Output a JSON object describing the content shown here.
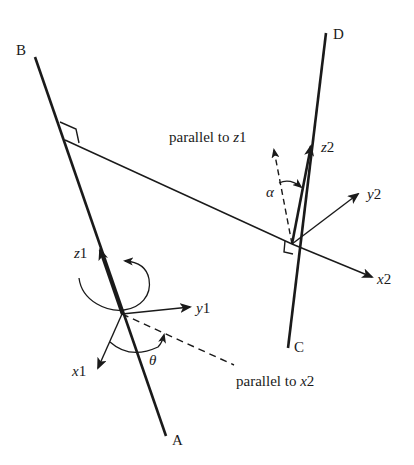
{
  "diagram": {
    "type": "kinematic-frame-diagram",
    "labels": {
      "point_b": "B",
      "point_a": "A",
      "point_d": "D",
      "point_c": "C",
      "parallel_z1_prefix": "parallel to ",
      "parallel_z1_var": "z",
      "parallel_z1_sub": "1",
      "parallel_x2_prefix": "parallel to ",
      "parallel_x2_var": "x",
      "parallel_x2_sub": "2",
      "z1_var": "z",
      "z1_sub": "1",
      "y1_var": "y",
      "y1_sub": "1",
      "x1_var": "x",
      "x1_sub": "1",
      "z2_var": "z",
      "z2_sub": "2",
      "y2_var": "y",
      "y2_sub": "2",
      "x2_var": "x",
      "x2_sub": "2",
      "theta": "θ",
      "alpha": "α"
    },
    "colors": {
      "stroke": "#1a1a1a",
      "background": "#ffffff"
    }
  }
}
